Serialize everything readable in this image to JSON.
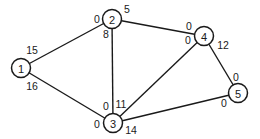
{
  "diagram": {
    "type": "network-graph",
    "nodes": [
      {
        "id": "1",
        "label": "1",
        "x": 21,
        "y": 68
      },
      {
        "id": "2",
        "label": "2",
        "x": 112,
        "y": 19
      },
      {
        "id": "3",
        "label": "3",
        "x": 113,
        "y": 123
      },
      {
        "id": "4",
        "label": "4",
        "x": 204,
        "y": 36
      },
      {
        "id": "5",
        "label": "5",
        "x": 238,
        "y": 93
      }
    ],
    "edges": [
      {
        "from": "1",
        "to": "2"
      },
      {
        "from": "1",
        "to": "3"
      },
      {
        "from": "2",
        "to": "3"
      },
      {
        "from": "2",
        "to": "4"
      },
      {
        "from": "3",
        "to": "4"
      },
      {
        "from": "3",
        "to": "5"
      },
      {
        "from": "4",
        "to": "5"
      }
    ],
    "edge_labels": [
      {
        "text": "15",
        "x": 32,
        "y": 50,
        "edge": "1-2",
        "near": "1"
      },
      {
        "text": "16",
        "x": 32,
        "y": 86,
        "edge": "1-3",
        "near": "1"
      },
      {
        "text": "0",
        "x": 97,
        "y": 19,
        "edge": "1-2",
        "near": "2"
      },
      {
        "text": "5",
        "x": 127,
        "y": 9,
        "edge": "2-4",
        "near": "2"
      },
      {
        "text": "8",
        "x": 106,
        "y": 34,
        "edge": "2-3",
        "near": "2"
      },
      {
        "text": "0",
        "x": 189,
        "y": 26,
        "edge": "2-4",
        "near": "4"
      },
      {
        "text": "0",
        "x": 188,
        "y": 40,
        "edge": "3-4",
        "near": "4"
      },
      {
        "text": "12",
        "x": 223,
        "y": 45,
        "edge": "4-5",
        "near": "4"
      },
      {
        "text": "0",
        "x": 236,
        "y": 77,
        "edge": "4-5",
        "near": "5"
      },
      {
        "text": "0",
        "x": 224,
        "y": 103,
        "edge": "3-5",
        "near": "5"
      },
      {
        "text": "0",
        "x": 106,
        "y": 106,
        "edge": "2-3",
        "near": "3"
      },
      {
        "text": "11",
        "x": 121,
        "y": 104,
        "edge": "3-4",
        "near": "3"
      },
      {
        "text": "0",
        "x": 97,
        "y": 124,
        "edge": "1-3",
        "near": "3"
      },
      {
        "text": "14",
        "x": 131,
        "y": 130,
        "edge": "3-5",
        "near": "3"
      }
    ],
    "colors": {
      "stroke": "#1a1a1a",
      "background": "#ffffff"
    },
    "node_radius": 9.5
  }
}
